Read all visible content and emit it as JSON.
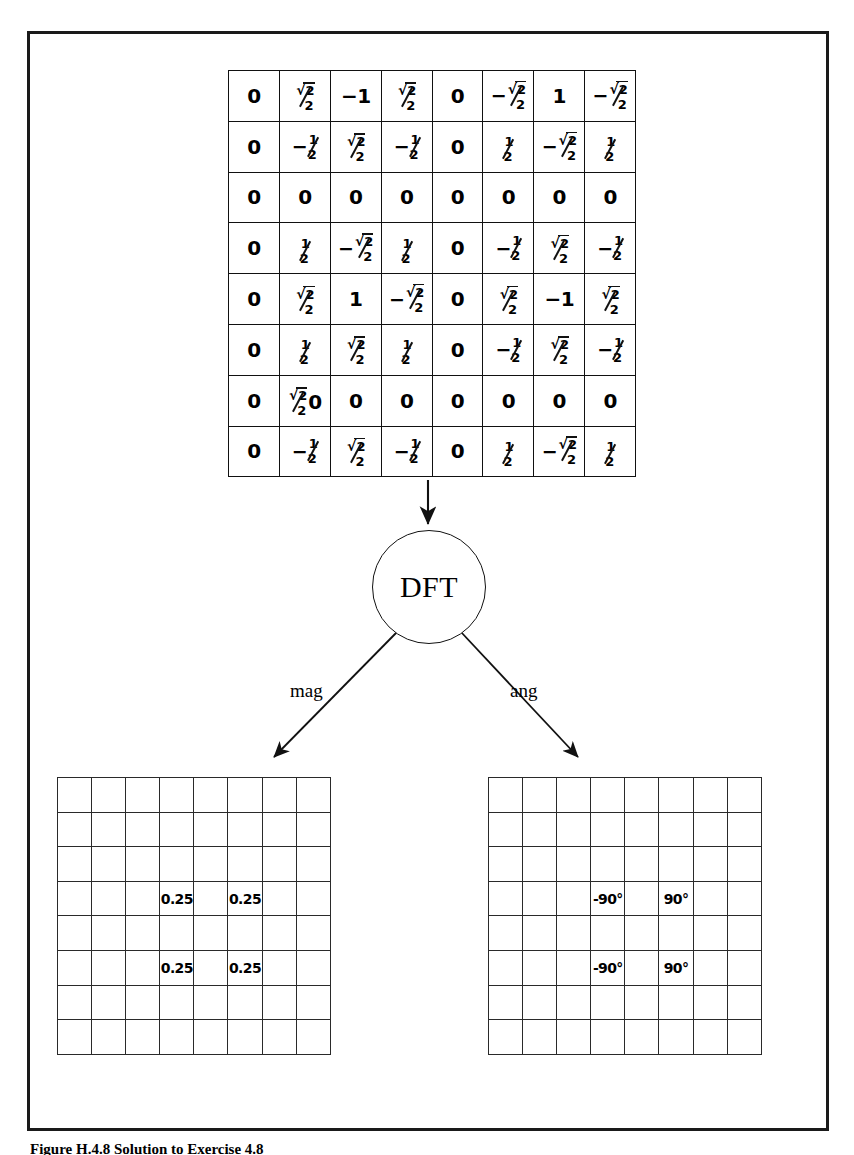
{
  "figure": {
    "caption": "Figure H.4.8 Solution to Exercise 4.8",
    "frame_color": "#1a1a1a"
  },
  "input_matrix": {
    "name": "input-image-matrix",
    "rows": 8,
    "cols": 8,
    "cells": [
      [
        "0",
        "sqrt2/2",
        "-1",
        "sqrt2/2",
        "0",
        "-sqrt2/2",
        "1",
        "-sqrt2/2"
      ],
      [
        "0",
        "-1/2",
        "sqrt2/2",
        "-1/2",
        "0",
        "1/2",
        "-sqrt2/2",
        "1/2"
      ],
      [
        "0",
        "0",
        "0",
        "0",
        "0",
        "0",
        "0",
        "0"
      ],
      [
        "0",
        "1/2",
        "-sqrt2/2",
        "1/2",
        "0",
        "-1/2",
        "sqrt2/2",
        "-1/2"
      ],
      [
        "0",
        "sqrt2/2",
        "1",
        "-sqrt2/2",
        "0",
        "sqrt2/2",
        "-1",
        "sqrt2/2"
      ],
      [
        "0",
        "1/2",
        "sqrt2/2",
        "1/2",
        "0",
        "-1/2",
        "sqrt2/2",
        "-1/2"
      ],
      [
        "0",
        "sqrt2/2 0",
        "0",
        "0",
        "0",
        "0",
        "0",
        "0"
      ],
      [
        "0",
        "-1/2",
        "sqrt2/2",
        "-1/2",
        "0",
        "1/2",
        "-sqrt2/2",
        "1/2"
      ]
    ],
    "display": [
      [
        "0",
        "√2/2",
        "−1",
        "√2/2",
        "0",
        "−√2/2",
        "1",
        "−√2/2"
      ],
      [
        "0",
        "−1/2",
        "√2/2",
        "−1/2",
        "0",
        "1/2",
        "−√2/2",
        "1/2"
      ],
      [
        "0",
        "0",
        "0",
        "0",
        "0",
        "0",
        "0",
        "0"
      ],
      [
        "0",
        "1/2",
        "−√2/2",
        "1/2",
        "0",
        "−1/2",
        "√2/2",
        "−1/2"
      ],
      [
        "0",
        "√2/2",
        "1",
        "−√2/2",
        "0",
        "√2/2",
        "−1",
        "√2/2"
      ],
      [
        "0",
        "1/2",
        "√2/2",
        "1/2",
        "0",
        "−1/2",
        "√2/2",
        "−1/2"
      ],
      [
        "0",
        "√2/2 0",
        "0",
        "0",
        "0",
        "0",
        "0",
        "0"
      ],
      [
        "0",
        "−1/2",
        "√2/2",
        "−1/2",
        "0",
        "1/2",
        "−√2/2",
        "1/2"
      ]
    ]
  },
  "transform_node": {
    "label": "DFT"
  },
  "branches": {
    "magnitude_label": "mag",
    "angle_label": "ang"
  },
  "magnitude_grid": {
    "name": "magnitude-output-grid",
    "rows": 8,
    "cols": 8,
    "values": [
      [
        "",
        "",
        "",
        "",
        "",
        "",
        "",
        ""
      ],
      [
        "",
        "",
        "",
        "",
        "",
        "",
        "",
        ""
      ],
      [
        "",
        "",
        "",
        "",
        "",
        "",
        "",
        ""
      ],
      [
        "",
        "",
        "",
        "0.25",
        "",
        "0.25",
        "",
        ""
      ],
      [
        "",
        "",
        "",
        "",
        "",
        "",
        "",
        ""
      ],
      [
        "",
        "",
        "",
        "0.25",
        "",
        "0.25",
        "",
        ""
      ],
      [
        "",
        "",
        "",
        "",
        "",
        "",
        "",
        ""
      ],
      [
        "",
        "",
        "",
        "",
        "",
        "",
        "",
        ""
      ]
    ]
  },
  "angle_grid": {
    "name": "angle-output-grid",
    "rows": 8,
    "cols": 8,
    "values": [
      [
        "",
        "",
        "",
        "",
        "",
        "",
        "",
        ""
      ],
      [
        "",
        "",
        "",
        "",
        "",
        "",
        "",
        ""
      ],
      [
        "",
        "",
        "",
        "",
        "",
        "",
        "",
        ""
      ],
      [
        "",
        "",
        "",
        "-90°",
        "",
        "90°",
        "",
        ""
      ],
      [
        "",
        "",
        "",
        "",
        "",
        "",
        "",
        ""
      ],
      [
        "",
        "",
        "",
        "-90°",
        "",
        "90°",
        "",
        ""
      ],
      [
        "",
        "",
        "",
        "",
        "",
        "",
        "",
        ""
      ],
      [
        "",
        "",
        "",
        "",
        "",
        "",
        "",
        ""
      ]
    ]
  },
  "chart_data": {
    "type": "heatmap",
    "panels": [
      {
        "name": "input",
        "role": "spatial-domain input image",
        "rows": 8,
        "cols": 8,
        "matrix": [
          [
            0,
            0.7071,
            -1,
            0.7071,
            0,
            -0.7071,
            1,
            -0.7071
          ],
          [
            0,
            -0.5,
            0.7071,
            -0.5,
            0,
            0.5,
            -0.7071,
            0.5
          ],
          [
            0,
            0,
            0,
            0,
            0,
            0,
            0,
            0
          ],
          [
            0,
            0.5,
            -0.7071,
            0.5,
            0,
            -0.5,
            0.7071,
            -0.5
          ],
          [
            0,
            0.7071,
            1,
            -0.7071,
            0,
            0.7071,
            -1,
            0.7071
          ],
          [
            0,
            0.5,
            0.7071,
            0.5,
            0,
            -0.5,
            0.7071,
            -0.5
          ],
          [
            0,
            0.7071,
            0,
            0,
            0,
            0,
            0,
            0
          ],
          [
            0,
            -0.5,
            0.7071,
            -0.5,
            0,
            0.5,
            -0.7071,
            0.5
          ]
        ]
      },
      {
        "name": "magnitude",
        "role": "DFT magnitude",
        "rows": 8,
        "cols": 8,
        "nonzero": [
          {
            "row": 4,
            "col": 4,
            "value": 0.25
          },
          {
            "row": 4,
            "col": 6,
            "value": 0.25
          },
          {
            "row": 6,
            "col": 4,
            "value": 0.25
          },
          {
            "row": 6,
            "col": 6,
            "value": 0.25
          }
        ]
      },
      {
        "name": "angle",
        "role": "DFT phase angle (degrees)",
        "rows": 8,
        "cols": 8,
        "nonzero": [
          {
            "row": 4,
            "col": 4,
            "value": -90
          },
          {
            "row": 4,
            "col": 6,
            "value": 90
          },
          {
            "row": 6,
            "col": 4,
            "value": -90
          },
          {
            "row": 6,
            "col": 6,
            "value": 90
          }
        ]
      }
    ],
    "flow": [
      "input",
      "DFT",
      "mag",
      "ang"
    ],
    "legend": [
      "mag",
      "ang"
    ],
    "grid": true
  }
}
